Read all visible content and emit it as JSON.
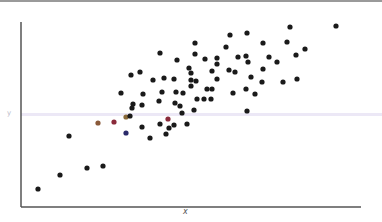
{
  "chart_data": {
    "type": "scatter",
    "title": "",
    "xlabel": "x",
    "ylabel": "y",
    "grid": false,
    "legend": null,
    "axis_ranges": {
      "x": [
        0,
        100
      ],
      "y": [
        0,
        100
      ]
    },
    "reference_line": {
      "orientation": "horizontal",
      "y_pixel": 114,
      "color": "#e6e2f2"
    },
    "point_color": "#1a1a1a",
    "points_px": [
      [
        38,
        189
      ],
      [
        60,
        175
      ],
      [
        69,
        136
      ],
      [
        87,
        168
      ],
      [
        103,
        166
      ],
      [
        98,
        123
      ],
      [
        114,
        122
      ],
      [
        126,
        117
      ],
      [
        130,
        116
      ],
      [
        133,
        104
      ],
      [
        142,
        105
      ],
      [
        159,
        101
      ],
      [
        175,
        103
      ],
      [
        180,
        106
      ],
      [
        150,
        138
      ],
      [
        142,
        127
      ],
      [
        160,
        124
      ],
      [
        166,
        134
      ],
      [
        169,
        128
      ],
      [
        174,
        125
      ],
      [
        182,
        113
      ],
      [
        187,
        124
      ],
      [
        194,
        110
      ],
      [
        247,
        111
      ],
      [
        121,
        93
      ],
      [
        131,
        75
      ],
      [
        140,
        72
      ],
      [
        143,
        94
      ],
      [
        153,
        80
      ],
      [
        162,
        92
      ],
      [
        164,
        78
      ],
      [
        174,
        79
      ],
      [
        176,
        92
      ],
      [
        183,
        93
      ],
      [
        132,
        108
      ],
      [
        160,
        53
      ],
      [
        177,
        60
      ],
      [
        189,
        68
      ],
      [
        191,
        80
      ],
      [
        191,
        73
      ],
      [
        191,
        86
      ],
      [
        195,
        43
      ],
      [
        195,
        54
      ],
      [
        196,
        81
      ],
      [
        197,
        99
      ],
      [
        204,
        99
      ],
      [
        205,
        59
      ],
      [
        207,
        89
      ],
      [
        211,
        99
      ],
      [
        212,
        71
      ],
      [
        212,
        89
      ],
      [
        217,
        58
      ],
      [
        217,
        64
      ],
      [
        217,
        79
      ],
      [
        226,
        47
      ],
      [
        229,
        70
      ],
      [
        230,
        35
      ],
      [
        233,
        93
      ],
      [
        235,
        72
      ],
      [
        238,
        57
      ],
      [
        246,
        56
      ],
      [
        246,
        89
      ],
      [
        247,
        33
      ],
      [
        248,
        62
      ],
      [
        251,
        77
      ],
      [
        255,
        94
      ],
      [
        262,
        82
      ],
      [
        263,
        43
      ],
      [
        263,
        69
      ],
      [
        269,
        57
      ],
      [
        277,
        62
      ],
      [
        283,
        82
      ],
      [
        287,
        42
      ],
      [
        290,
        27
      ],
      [
        296,
        55
      ],
      [
        297,
        79
      ],
      [
        305,
        49
      ],
      [
        336,
        26
      ]
    ],
    "highlight_points_px": [
      {
        "xy": [
          98,
          123
        ],
        "color": "#8a5a3a"
      },
      {
        "xy": [
          114,
          122
        ],
        "color": "#8a2a3a"
      },
      {
        "xy": [
          126,
          117
        ],
        "color": "#8a6a3a"
      },
      {
        "xy": [
          168,
          119
        ],
        "color": "#8a2a3a"
      },
      {
        "xy": [
          126,
          133
        ],
        "color": "#2a2a6a"
      }
    ]
  },
  "axes": {
    "x_axis": {
      "x1": 21,
      "x2": 361,
      "y": 207,
      "color": "#555555"
    },
    "y_axis": {
      "x": 21,
      "y1": 22,
      "y2": 207,
      "color": "#555555"
    }
  },
  "labels": {
    "x": "x",
    "y": "y"
  }
}
